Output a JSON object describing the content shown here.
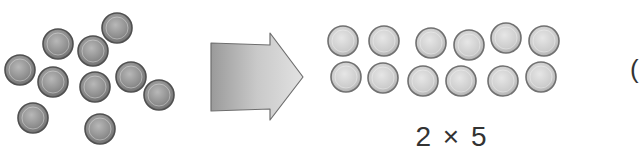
{
  "diagram": {
    "left_group": {
      "name": "scattered-counters",
      "count": 10,
      "color": "#8a8a8a"
    },
    "arrow": {
      "direction": "right",
      "color": "#bdbdbd"
    },
    "right_group": {
      "name": "arranged-counters",
      "rows": 2,
      "per_row": 6,
      "color": "#cfcfcf"
    },
    "label": "2 × 5",
    "edge_text": "("
  }
}
